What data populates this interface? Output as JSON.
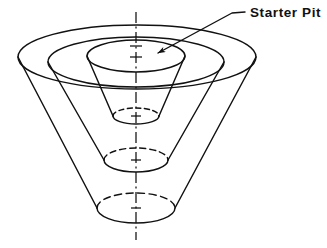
{
  "figure": {
    "background_color": "#ffffff",
    "line_color": "#111111",
    "canvas": {
      "width": 327,
      "height": 248
    }
  },
  "annotations": [
    {
      "id": "starter-pit-callout",
      "label": "Starter Pit",
      "label_x": 250,
      "label_y": 17,
      "leader": {
        "tail_x": 245,
        "tail_y": 12,
        "elbow_x": 232,
        "elbow_y": 13,
        "tip_x": 151,
        "tip_y": 58,
        "arrowhead": true
      }
    }
  ],
  "axis": {
    "name": "centerline",
    "style": "dash-dot",
    "x": 136,
    "y_top": 12,
    "y_bottom": 240,
    "tick_marks_y": [
      46,
      57,
      116,
      160,
      208
    ]
  },
  "chart_data": {
    "type": "diagram",
    "projection": "isometric-like, ellipse rims",
    "center_x": 136,
    "cones": [
      {
        "name": "outer-pit-shell",
        "order": 3,
        "rim": {
          "cx": 137,
          "cy": 57,
          "rx": 119,
          "ry": 32
        },
        "base": {
          "cx": 136,
          "cy": 208,
          "rx": 39,
          "ry": 15
        },
        "base_hidden_top_half": true
      },
      {
        "name": "intermediate-pit-shell",
        "order": 2,
        "rim": {
          "cx": 136,
          "cy": 62,
          "rx": 88,
          "ry": 25
        },
        "base": {
          "cx": 136,
          "cy": 160,
          "rx": 32,
          "ry": 12
        },
        "base_hidden_top_half": true
      },
      {
        "name": "starter-pit",
        "order": 1,
        "rim": {
          "cx": 136,
          "cy": 56,
          "rx": 49,
          "ry": 16
        },
        "base": {
          "cx": 136,
          "cy": 116,
          "rx": 23,
          "ry": 8
        },
        "base_hidden_top_half": true
      }
    ]
  }
}
